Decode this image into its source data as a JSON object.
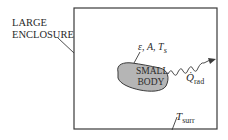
{
  "diagram": {
    "enclosure": {
      "label_line1": "LARGE",
      "label_line2": "ENCLOSURE",
      "surface_temperature_symbol": "T",
      "surface_temperature_subscript": "surr"
    },
    "small_body": {
      "label_line1": "SMALL",
      "label_line2": "BODY",
      "properties": "ε, A, T",
      "properties_subscript": "s",
      "fill_color": "#b5b5b5"
    },
    "radiation": {
      "symbol": "Q̇",
      "subscript": "rad"
    },
    "colors": {
      "line": "#3a3a3a",
      "background": "#ffffff"
    }
  }
}
